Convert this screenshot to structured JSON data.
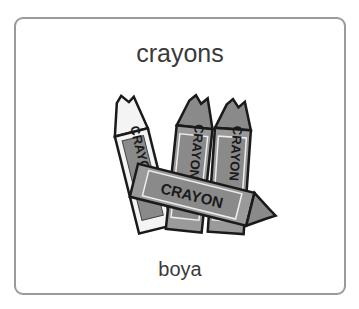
{
  "card": {
    "title": "crayons",
    "translation": "boya",
    "image": {
      "icon": "crayons-illustration",
      "label_text": "CRAYON"
    }
  },
  "colors": {
    "border": "#9a9a9a",
    "text": "#3a3a3a",
    "crayon_body": "#8a8a8a",
    "crayon_label": "#7a7a7a",
    "outline": "#1a1a1a"
  }
}
